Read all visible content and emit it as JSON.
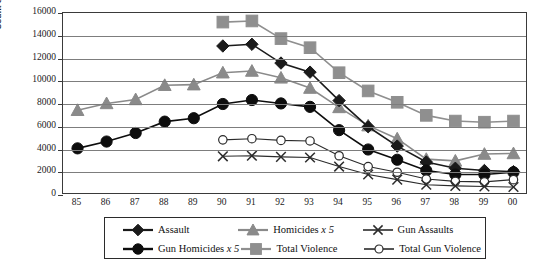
{
  "chart_data": {
    "type": "line",
    "title": "",
    "xlabel": "",
    "ylabel": "Count of Injuries",
    "ylim": [
      0,
      16000
    ],
    "ytick_step": 2000,
    "yticks": [
      "0",
      "2000",
      "4000",
      "6000",
      "8000",
      "10000",
      "12000",
      "14000",
      "16000"
    ],
    "grid": true,
    "legend_position": "bottom",
    "categories": [
      "85",
      "86",
      "87",
      "88",
      "89",
      "90",
      "91",
      "92",
      "93",
      "94",
      "95",
      "96",
      "97",
      "98",
      "99",
      "00"
    ],
    "series": [
      {
        "name": "Assault",
        "marker": "diamond",
        "color": "#1a1a1a",
        "values": [
          null,
          null,
          null,
          null,
          null,
          13100,
          13250,
          11600,
          10800,
          8300,
          6000,
          4300,
          2900,
          2350,
          2150,
          2050
        ]
      },
      {
        "name": "Homicides x 5",
        "marker": "triangle",
        "color": "#8a8a8a",
        "values": [
          7450,
          8050,
          8400,
          9650,
          9700,
          10750,
          10900,
          10300,
          9400,
          7700,
          6100,
          4950,
          3150,
          3000,
          3600,
          3650
        ]
      },
      {
        "name": "Gun Assaults",
        "marker": "cross",
        "color": "#2b2b2b",
        "values": [
          null,
          null,
          null,
          null,
          null,
          3400,
          3450,
          3350,
          3300,
          2500,
          1800,
          1350,
          900,
          800,
          750,
          700
        ]
      },
      {
        "name": "Gun Homicides x 5",
        "marker": "circle-filled",
        "color": "#0d0d0d",
        "values": [
          4100,
          4700,
          5450,
          6450,
          6750,
          8000,
          8350,
          8050,
          7750,
          5700,
          4000,
          3100,
          2150,
          1800,
          1800,
          2000
        ]
      },
      {
        "name": "Total Violence",
        "marker": "square",
        "color": "#8f8f8f",
        "values": [
          null,
          null,
          null,
          null,
          null,
          15200,
          15300,
          13750,
          12950,
          10750,
          9150,
          8150,
          7000,
          6500,
          6400,
          6500
        ]
      },
      {
        "name": "Total Gun Violence",
        "marker": "circle-open",
        "color": "#2b2b2b",
        "values": [
          null,
          null,
          null,
          null,
          null,
          4850,
          4950,
          4800,
          4750,
          3450,
          2500,
          2000,
          1400,
          1200,
          1150,
          1350
        ]
      }
    ]
  },
  "axis": {
    "y_title": "Count of Injuries"
  },
  "legend": {
    "rows": [
      [
        {
          "label": "Assault",
          "key": "line-diamond-black"
        },
        {
          "label": "Homicides x 5",
          "key": "line-triangle-gray"
        },
        {
          "label": "Gun Assaults",
          "key": "line-cross-black"
        }
      ],
      [
        {
          "label": "Gun Homicides x 5",
          "key": "line-circle-filled-black"
        },
        {
          "label": "Total Violence",
          "key": "line-square-gray"
        },
        {
          "label": "Total Gun Violence",
          "key": "line-circle-open-black"
        }
      ]
    ]
  },
  "colors": {
    "dark": "#1a1a1a",
    "gray": "#8a8a8a",
    "grid": "#7d7d7d",
    "frame": "#3a3a3a"
  }
}
